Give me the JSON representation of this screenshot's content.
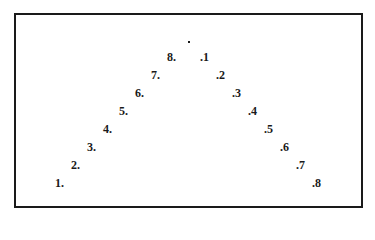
{
  "diagram": {
    "type": "inverted-v-numbered-points",
    "frame": {
      "left": 14,
      "top": 13,
      "right": 361,
      "bottom": 206
    },
    "apex": {
      "label": ".",
      "x": 188,
      "y": 41
    },
    "left_arm": [
      {
        "label": "1.",
        "x": 55,
        "y": 177
      },
      {
        "label": "2.",
        "x": 71,
        "y": 159
      },
      {
        "label": "3.",
        "x": 87,
        "y": 141
      },
      {
        "label": "4.",
        "x": 103,
        "y": 123
      },
      {
        "label": "5.",
        "x": 119,
        "y": 105
      },
      {
        "label": "6.",
        "x": 135,
        "y": 87
      },
      {
        "label": "7.",
        "x": 151,
        "y": 69
      },
      {
        "label": "8.",
        "x": 167,
        "y": 51
      }
    ],
    "right_arm": [
      {
        "label": ".1",
        "x": 200,
        "y": 51
      },
      {
        "label": ".2",
        "x": 216,
        "y": 69
      },
      {
        "label": ".3",
        "x": 232,
        "y": 87
      },
      {
        "label": ".4",
        "x": 248,
        "y": 105
      },
      {
        "label": ".5",
        "x": 264,
        "y": 123
      },
      {
        "label": ".6",
        "x": 280,
        "y": 141
      },
      {
        "label": ".7",
        "x": 296,
        "y": 159
      },
      {
        "label": ".8",
        "x": 312,
        "y": 177
      }
    ]
  }
}
